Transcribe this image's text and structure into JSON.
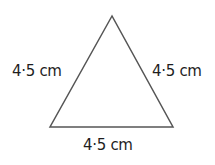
{
  "diagram": {
    "shape": "equilateral-triangle",
    "stroke_color": "#555555",
    "vertices": {
      "top": [
        112,
        16
      ],
      "bottom_left": [
        50,
        127
      ],
      "bottom_right": [
        173,
        127
      ]
    },
    "labels": {
      "left_side": "4·5 cm",
      "right_side": "4·5 cm",
      "base": "4·5 cm"
    }
  }
}
